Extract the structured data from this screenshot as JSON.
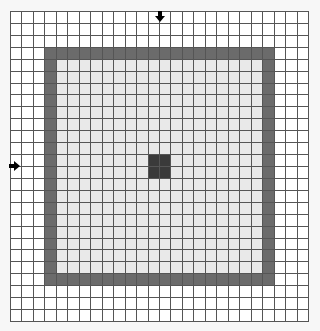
{
  "board": {
    "cols": 26,
    "rows": 26,
    "colors": {
      "empty": "#ffffff",
      "inner": "#e9e9e9",
      "band": "#6b6b6b",
      "center": "#3a3a3a",
      "grid_line": "#555555",
      "background": "#f7f7f7"
    },
    "outer_band": {
      "col_start": 3,
      "col_end": 22,
      "row_start": 3,
      "row_end": 22
    },
    "center_block": {
      "col_start": 12,
      "col_end": 13,
      "row_start": 12,
      "row_end": 13
    }
  },
  "markers": {
    "top": {
      "icon": "arrow-down-icon",
      "column_between": [
        12,
        13
      ]
    },
    "left": {
      "icon": "arrow-right-icon",
      "row_between": [
        12,
        13
      ]
    }
  }
}
